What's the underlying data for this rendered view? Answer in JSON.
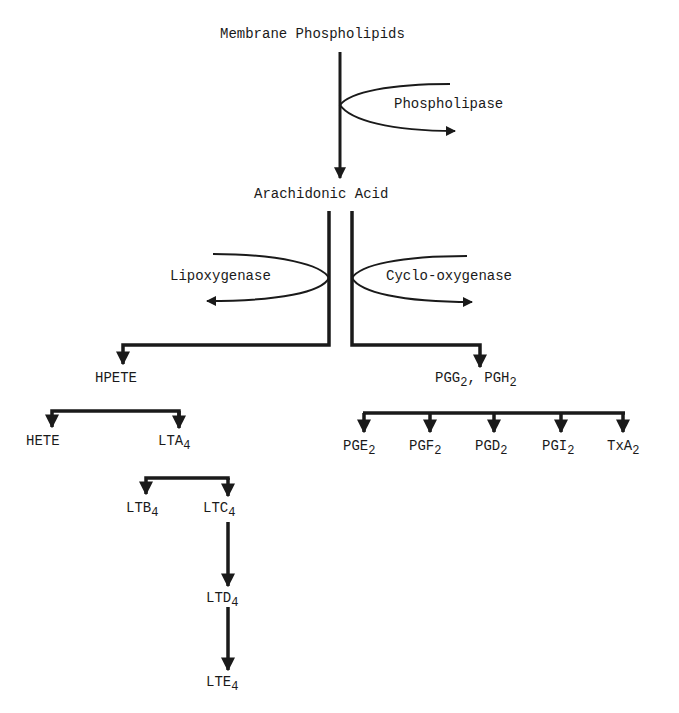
{
  "diagram": {
    "colors": {
      "ink": "#1a1a1a",
      "background": "#ffffff"
    },
    "nodes": {
      "membrane": {
        "text": "Membrane Phospholipids"
      },
      "arachidonic": {
        "text": "Arachidonic Acid"
      },
      "hpete": {
        "text": "HPETE"
      },
      "pgg_pgh": {
        "base1": "PGG",
        "sub1": "2",
        "sep": ", ",
        "base2": "PGH",
        "sub2": "2"
      },
      "hete": {
        "text": "HETE"
      },
      "lta4": {
        "base": "LTA",
        "sub": "4"
      },
      "ltb4": {
        "base": "LTB",
        "sub": "4"
      },
      "ltc4": {
        "base": "LTC",
        "sub": "4"
      },
      "ltd4": {
        "base": "LTD",
        "sub": "4"
      },
      "lte4": {
        "base": "LTE",
        "sub": "4"
      },
      "pge2": {
        "base": "PGE",
        "sub": "2"
      },
      "pgf2": {
        "base": "PGF",
        "sub": "2"
      },
      "pgd2": {
        "base": "PGD",
        "sub": "2"
      },
      "pgi2": {
        "base": "PGI",
        "sub": "2"
      },
      "txa2": {
        "base": "TxA",
        "sub": "2"
      }
    },
    "enzymes": {
      "phospholipase": "Phospholipase",
      "lipoxygenase": "Lipoxygenase",
      "cyclooxygenase": "Cyclo-oxygenase"
    }
  }
}
